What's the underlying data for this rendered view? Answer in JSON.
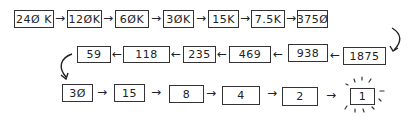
{
  "diagram": {
    "rows": [
      {
        "direction": "left-to-right",
        "nodes": [
          "240K",
          "120K",
          "60K",
          "30K",
          "15K",
          "7.5K",
          "3750"
        ]
      },
      {
        "direction": "right-to-left",
        "nodes": [
          "1875",
          "938",
          "469",
          "235",
          "118",
          "59"
        ]
      },
      {
        "direction": "left-to-right",
        "nodes": [
          "30",
          "15",
          "8",
          "4",
          "2",
          "1"
        ]
      }
    ],
    "final_node_highlight": "burst-rays",
    "arrow_glyph_right": "→",
    "arrow_glyph_left": "←"
  },
  "display": {
    "r1": [
      "24Ø K",
      "12ØK",
      "6ØK",
      "3ØK",
      "15K",
      "7.5K",
      "375Ø"
    ],
    "r2": [
      "1875",
      "938",
      "469",
      "235",
      "118",
      "59"
    ],
    "r3": [
      "3Ø",
      "15",
      "8",
      "4",
      "2",
      "1"
    ]
  }
}
